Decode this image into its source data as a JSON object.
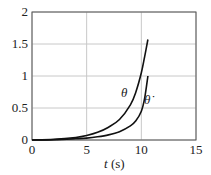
{
  "chart_data": {
    "type": "line",
    "title": "",
    "xlabel": "t (s)",
    "ylabel": "",
    "xlim": [
      0,
      15
    ],
    "ylim": [
      0,
      2
    ],
    "xticks": [
      0,
      5,
      10,
      15
    ],
    "yticks": [
      0,
      0.5,
      1,
      1.5,
      2
    ],
    "ytick_labels": [
      "0",
      "0.5",
      "1",
      "1.5",
      "2"
    ],
    "grid": true,
    "legend": "inline labels",
    "series": [
      {
        "name": "θ",
        "x": [
          0,
          2,
          4,
          5,
          6,
          7,
          8,
          9,
          9.5,
          10,
          10.3,
          10.6
        ],
        "y": [
          0,
          0.01,
          0.04,
          0.07,
          0.12,
          0.2,
          0.32,
          0.55,
          0.75,
          1.05,
          1.3,
          1.57
        ]
      },
      {
        "name": "θ̇",
        "x": [
          0,
          2,
          4,
          5,
          6,
          7,
          8,
          9,
          9.5,
          10,
          10.3,
          10.6
        ],
        "y": [
          0,
          0.005,
          0.02,
          0.03,
          0.05,
          0.08,
          0.13,
          0.22,
          0.3,
          0.45,
          0.65,
          1.0
        ]
      }
    ]
  },
  "labels": {
    "xaxis_var": "t",
    "xaxis_unit": " (s)",
    "theta": "θ",
    "theta_dot": "θ̇"
  }
}
